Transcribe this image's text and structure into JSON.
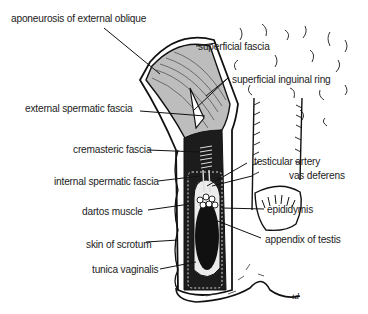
{
  "diagram": {
    "labels": {
      "aponeurosis": "aponeurosis of external oblique",
      "superficial_fascia": "superficial fascia",
      "superficial_inguinal_ring": "superficial inguinal ring",
      "external_spermatic_fascia": "external spermatic fascia",
      "cremasteric_fascia": "cremasteric fascia",
      "testicular_artery": "testicular artery",
      "vas_deferens": "vas deferens",
      "internal_spermatic_fascia": "internal spermatic fascia",
      "dartos_muscle": "dartos muscle",
      "epididymis": "epididymis",
      "skin_of_scrotum": "skin of scrotum",
      "appendix_of_testis": "appendix of testis",
      "tunica_vaginalis": "tunica vaginalis"
    },
    "signature": "td",
    "colors": {
      "line": "#111111",
      "fascia_gray": "#bdbdbd",
      "dark": "#1a1a1a",
      "pale": "#ececec"
    }
  }
}
